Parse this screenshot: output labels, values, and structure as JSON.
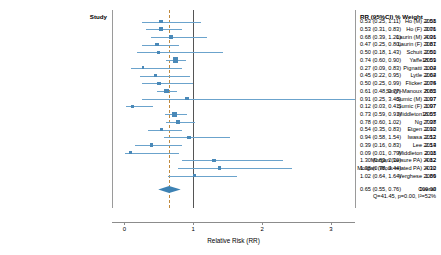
{
  "chart_data": {
    "type": "forest",
    "title": "",
    "xlabel": "Relative Risk (RR)",
    "ylabel": "",
    "xlim": [
      -0.18,
      3.35
    ],
    "xticks": [
      0,
      1,
      2,
      3
    ],
    "xticklabels": [
      "0",
      "1",
      "2",
      "3"
    ],
    "grid": false,
    "null_value": 1,
    "pooled_value": 0.65,
    "columns": {
      "study_header": "Study",
      "stat_header": "RR (95%CI)   % Weight"
    },
    "rows": [
      {
        "study": "Ho (M) 2001",
        "rr": 0.53,
        "lo": 0.25,
        "hi": 1.11,
        "weight": 2.58,
        "rr_text": "0.53 (0.25, 1.11)",
        "weight_text": "2.58"
      },
      {
        "study": "Ho (F) 2001",
        "rr": 0.53,
        "lo": 0.31,
        "hi": 0.83,
        "weight": 3.76,
        "rr_text": "0.53 (0.31, 0.83)",
        "weight_text": "3.76"
      },
      {
        "study": "Laurin (M) 2001",
        "rr": 0.68,
        "lo": 0.39,
        "hi": 1.2,
        "weight": 4.36,
        "rr_text": "0.68 (0.39, 1.20)",
        "weight_text": "4.36"
      },
      {
        "study": "Laurin (F) 2001",
        "rr": 0.47,
        "lo": 0.25,
        "hi": 0.8,
        "weight": 3.87,
        "rr_text": "0.47 (0.25, 0.80)",
        "weight_text": "3.87"
      },
      {
        "study": "Schuit 2001",
        "rr": 0.5,
        "lo": 0.18,
        "hi": 1.43,
        "weight": 2.5,
        "rr_text": "0.50 (0.18, 1.43)",
        "weight_text": "2.50"
      },
      {
        "study": "Yaffe 2001",
        "rr": 0.74,
        "lo": 0.6,
        "hi": 0.9,
        "weight": 18.59,
        "rr_text": "0.74 (0.60, 0.90)",
        "weight_text": "18.59"
      },
      {
        "study": "Pignatti 2002",
        "rr": 0.27,
        "lo": 0.09,
        "hi": 0.83,
        "weight": 1.04,
        "rr_text": "0.27 (0.09, 0.83)",
        "weight_text": "1.04"
      },
      {
        "study": "Lytle 2004",
        "rr": 0.45,
        "lo": 0.22,
        "hi": 0.95,
        "weight": 2.62,
        "rr_text": "0.45 (0.22, 0.95)",
        "weight_text": "2.62"
      },
      {
        "study": "Flicker 2005",
        "rr": 0.5,
        "lo": 0.25,
        "hi": 0.99,
        "weight": 2.74,
        "rr_text": "0.50 (0.25, 0.99)",
        "weight_text": "2.74"
      },
      {
        "study": "Singh-Manoux 2005",
        "rr": 0.61,
        "lo": 0.48,
        "hi": 0.77,
        "weight": 8.82,
        "rr_text": "0.61 (0.48, 0.77)",
        "weight_text": "8.82"
      },
      {
        "study": "Sumic (M) 2007",
        "rr": 0.91,
        "lo": 0.25,
        "hi": 3.4,
        "weight": 1.97,
        "rr_text": "0.91 (0.25, 3.40)",
        "weight_text": "1.97"
      },
      {
        "study": "Sumic (F) 2007",
        "rr": 0.12,
        "lo": 0.03,
        "hi": 0.41,
        "weight": 1.97,
        "rr_text": "0.12 (0.03, 0.41)",
        "weight_text": "1.97"
      },
      {
        "study": "Middleton 2007",
        "rr": 0.73,
        "lo": 0.59,
        "hi": 0.91,
        "weight": 16.55,
        "rr_text": "0.73 (0.59, 0.91)",
        "weight_text": "16.55"
      },
      {
        "study": "Ng 2008",
        "rr": 0.78,
        "lo": 0.6,
        "hi": 1.02,
        "weight": 7.37,
        "rr_text": "0.78 (0.60, 1.02)",
        "weight_text": "7.37"
      },
      {
        "study": "Etgen 2010",
        "rr": 0.54,
        "lo": 0.35,
        "hi": 0.83,
        "weight": 2.92,
        "rr_text": "0.54 (0.35, 0.83)",
        "weight_text": "2.92"
      },
      {
        "study": "Iwasa 2012",
        "rr": 0.94,
        "lo": 0.58,
        "hi": 1.54,
        "weight": 2.53,
        "rr_text": "0.94 (0.58, 1.54)",
        "weight_text": "2.53"
      },
      {
        "study": "Lee 2013",
        "rr": 0.39,
        "lo": 0.16,
        "hi": 0.83,
        "weight": 2.54,
        "rr_text": "0.39 (0.16, 0.83)",
        "weight_text": "2.54"
      },
      {
        "study": "Middleton 2011",
        "rr": 0.09,
        "lo": 0.01,
        "hi": 0.79,
        "weight": 2.08,
        "rr_text": "0.09 (0.01, 0.79)",
        "weight_text": "2.08"
      },
      {
        "study": "Morgan (Leisure PA) 2012",
        "rr": 1.3,
        "lo": 0.83,
        "hi": 2.3,
        "weight": 4.82,
        "rr_text": "1.30 (0.83, 2.30)",
        "weight_text": "4.82"
      },
      {
        "study": "Morgan (Work-related PA) 2012",
        "rr": 1.38,
        "lo": 0.78,
        "hi": 2.44,
        "weight": 4.3,
        "rr_text": "1.38 (0.78, 2.44)",
        "weight_text": "4.30"
      },
      {
        "study": "Verghese 2009",
        "rr": 1.02,
        "lo": 0.64,
        "hi": 1.64,
        "weight": 1.86,
        "rr_text": "1.02 (0.64, 1.64)",
        "weight_text": "1.86"
      }
    ],
    "overall": {
      "label": "Overall",
      "heterogeneity": "Q=41.45, p=0.00, I²=52%",
      "rr": 0.65,
      "lo": 0.55,
      "hi": 0.76,
      "rr_text": "0.65 (0.55, 0.76)",
      "weight_text": "100.00"
    },
    "colors": {
      "marker": "#4a89b8",
      "ci": "#6ba3cc",
      "diamond": "#3d82b4",
      "null_line": "#555555",
      "pooled_line": "#c08a3e",
      "axis": "#8c8c8c"
    }
  }
}
